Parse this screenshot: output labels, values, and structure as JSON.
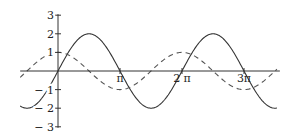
{
  "chart_data": {
    "type": "line",
    "title": "",
    "xlabel": "",
    "ylabel": "",
    "xlim_pi": [
      -0.61,
      3.53
    ],
    "ylim": [
      -3,
      3
    ],
    "grid": false,
    "legend": "none",
    "x_ticks": [
      {
        "value_pi": 1,
        "label": "π"
      },
      {
        "value_pi": 2,
        "label": "2 π"
      },
      {
        "value_pi": 3,
        "label": "3π"
      }
    ],
    "y_ticks": [
      {
        "value": 3,
        "label": "3"
      },
      {
        "value": 2,
        "label": "2"
      },
      {
        "value": 1,
        "label": "1"
      },
      {
        "value": -1,
        "label": "− 1"
      },
      {
        "value": -2,
        "label": "− 2"
      },
      {
        "value": -3,
        "label": "− 3"
      }
    ],
    "series": [
      {
        "name": "2 sin x",
        "style": "solid",
        "color": "#333333",
        "amplitude": 2,
        "func": "sin"
      },
      {
        "name": "cos x",
        "style": "dashed",
        "color": "#555555",
        "amplitude": 1,
        "func": "cos"
      }
    ]
  }
}
